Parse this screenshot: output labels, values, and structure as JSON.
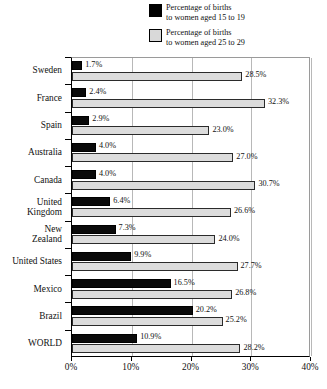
{
  "legend": {
    "position": "top-right",
    "entries": [
      {
        "swatch": "black",
        "line1": "Percentage of births",
        "line2": "to women aged 15 to 19",
        "color": "#000000"
      },
      {
        "swatch": "light",
        "line1": "Percentage of births",
        "line2": "to women aged 25 to 29",
        "color": "#d9d9d9"
      }
    ]
  },
  "axis": {
    "x_ticks": [
      "0%",
      "10%",
      "20%",
      "30%",
      "40%"
    ],
    "x_tick_values": [
      0,
      10,
      20,
      30,
      40
    ]
  },
  "chart_data": {
    "type": "bar",
    "orientation": "horizontal",
    "title": "",
    "subtitle": "",
    "xlabel": "",
    "ylabel": "",
    "xlim": [
      0,
      40
    ],
    "grid": true,
    "grid_axis": "x",
    "legend_position": "top-right",
    "value_suffix": "%",
    "categories": [
      "Sweden",
      "France",
      "Spain",
      "Australia",
      "Canada",
      "United Kingdom",
      "New Zealand",
      "United States",
      "Mexico",
      "Brazil",
      "WORLD"
    ],
    "series": [
      {
        "name": "Percentage of births to women aged 15 to 19",
        "color": "#000000",
        "values": [
          1.7,
          2.4,
          2.9,
          4.0,
          4.0,
          6.4,
          7.3,
          9.9,
          16.5,
          20.2,
          10.9
        ],
        "labels": [
          "1.7%",
          "2.4%",
          "2.9%",
          "4.0%",
          "4.0%",
          "6.4%",
          "7.3%",
          "9.9%",
          "16.5%",
          "20.2%",
          "10.9%"
        ]
      },
      {
        "name": "Percentage of births to women aged 25 to 29",
        "color": "#d9d9d9",
        "values": [
          28.5,
          32.3,
          23.0,
          27.0,
          30.7,
          26.6,
          24.0,
          27.7,
          26.8,
          25.2,
          28.2
        ],
        "labels": [
          "28.5%",
          "32.3%",
          "23.0%",
          "27.0%",
          "30.7%",
          "26.6%",
          "24.0%",
          "27.7%",
          "26.8%",
          "25.2%",
          "28.2%"
        ]
      }
    ]
  }
}
